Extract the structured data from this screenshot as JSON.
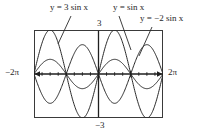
{
  "figure": {
    "title": "",
    "frame": {
      "x0": 34,
      "y0": 30,
      "x1": 163,
      "y1": 118
    },
    "axes": {
      "origin_x": 98,
      "origin_y": 74,
      "x_left_label": "−2π",
      "x_right_label": "2π",
      "y_top_label": "3",
      "y_bottom_label": "−3"
    },
    "annotations": [
      {
        "id": "label-3sinx",
        "text": "y = 3 sin x"
      },
      {
        "id": "label-sinx",
        "text": "y = sin x"
      },
      {
        "id": "label-neg2sinx",
        "text": "y = −2 sin x"
      }
    ]
  },
  "chart_data": {
    "type": "line",
    "title": "",
    "xlabel": "x",
    "ylabel": "y",
    "xlim": [
      -6.283185,
      6.283185
    ],
    "ylim": [
      -3,
      3
    ],
    "xticks": [
      -6.283185,
      -4.712389,
      -3.141593,
      -1.570796,
      0,
      1.570796,
      3.141593,
      4.712389,
      6.283185
    ],
    "xticklabels": [
      "−2π",
      "",
      "",
      "",
      "",
      "",
      "",
      "",
      "2π"
    ],
    "yticks": [
      -3,
      3
    ],
    "yticklabels": [
      "−3",
      "3"
    ],
    "grid": false,
    "legend": "inline-annotations",
    "series": [
      {
        "name": "y = 3 sin x",
        "expression": "3*sin(x)",
        "amplitude": 3,
        "period": 6.283185,
        "color": "#1f1f1f",
        "key_points": [
          {
            "x": -6.283185,
            "y": 0
          },
          {
            "x": -4.712389,
            "y": 3
          },
          {
            "x": -3.141593,
            "y": 0
          },
          {
            "x": -1.570796,
            "y": -3
          },
          {
            "x": 0,
            "y": 0
          },
          {
            "x": 1.570796,
            "y": 3
          },
          {
            "x": 3.141593,
            "y": 0
          },
          {
            "x": 4.712389,
            "y": -3
          },
          {
            "x": 6.283185,
            "y": 0
          }
        ]
      },
      {
        "name": "y = sin x",
        "expression": "sin(x)",
        "amplitude": 1,
        "period": 6.283185,
        "color": "#1f1f1f",
        "key_points": [
          {
            "x": -6.283185,
            "y": 0
          },
          {
            "x": -4.712389,
            "y": 1
          },
          {
            "x": -3.141593,
            "y": 0
          },
          {
            "x": -1.570796,
            "y": -1
          },
          {
            "x": 0,
            "y": 0
          },
          {
            "x": 1.570796,
            "y": 1
          },
          {
            "x": 3.141593,
            "y": 0
          },
          {
            "x": 4.712389,
            "y": -1
          },
          {
            "x": 6.283185,
            "y": 0
          }
        ]
      },
      {
        "name": "y = −2 sin x",
        "expression": "-2*sin(x)",
        "amplitude": 2,
        "period": 6.283185,
        "color": "#1f1f1f",
        "key_points": [
          {
            "x": -6.283185,
            "y": 0
          },
          {
            "x": -4.712389,
            "y": -2
          },
          {
            "x": -3.141593,
            "y": 0
          },
          {
            "x": -1.570796,
            "y": 2
          },
          {
            "x": 0,
            "y": 0
          },
          {
            "x": 1.570796,
            "y": -2
          },
          {
            "x": 3.141593,
            "y": 0
          },
          {
            "x": 4.712389,
            "y": 2
          },
          {
            "x": 6.283185,
            "y": 0
          }
        ]
      }
    ]
  },
  "colors": {
    "ink": "#1f1f1f",
    "frame": "#3a3a3a",
    "background": "#ffffff"
  }
}
